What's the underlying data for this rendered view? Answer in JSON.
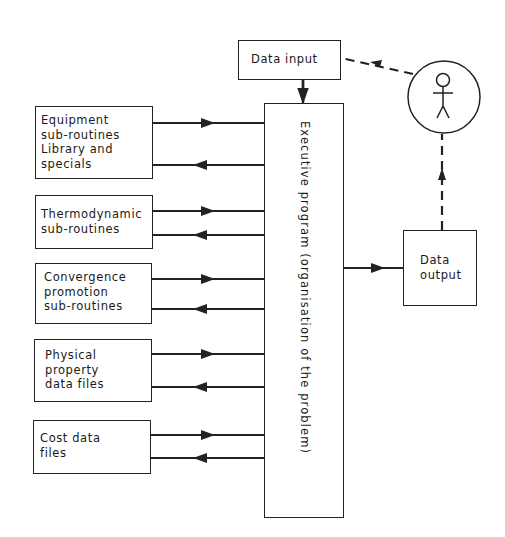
{
  "diagram": {
    "nodes": {
      "data_input": {
        "label": "Data input"
      },
      "executive": {
        "label": "Executive program (organisation of the problem)"
      },
      "data_output": {
        "label": "Data\noutput"
      },
      "user": {
        "label": "",
        "icon": "stick-figure-user"
      },
      "equipment": {
        "label": "Equipment\nsub-routines\nLibrary and\nspecials"
      },
      "thermodynamic": {
        "label": "Thermodynamic\nsub-routines"
      },
      "convergence": {
        "label": "Convergence\npromotion\nsub-routines"
      },
      "physical": {
        "label": "Physical\nproperty\ndata files"
      },
      "cost": {
        "label": "Cost data\nfiles"
      }
    },
    "edges": [
      {
        "from": "user",
        "to": "data_input",
        "style": "dashed"
      },
      {
        "from": "data_input",
        "to": "executive",
        "style": "solid"
      },
      {
        "from": "executive",
        "to": "data_output",
        "style": "solid"
      },
      {
        "from": "data_output",
        "to": "user",
        "style": "dashed"
      },
      {
        "from": "equipment",
        "to": "executive",
        "style": "solid"
      },
      {
        "from": "executive",
        "to": "equipment",
        "style": "solid"
      },
      {
        "from": "thermodynamic",
        "to": "executive",
        "style": "solid"
      },
      {
        "from": "executive",
        "to": "thermodynamic",
        "style": "solid"
      },
      {
        "from": "convergence",
        "to": "executive",
        "style": "solid"
      },
      {
        "from": "executive",
        "to": "convergence",
        "style": "solid"
      },
      {
        "from": "physical",
        "to": "executive",
        "style": "solid"
      },
      {
        "from": "executive",
        "to": "physical",
        "style": "solid"
      },
      {
        "from": "cost",
        "to": "executive",
        "style": "solid"
      },
      {
        "from": "executive",
        "to": "cost",
        "style": "solid"
      }
    ],
    "colors": {
      "line": "#222222",
      "background": "#ffffff"
    }
  }
}
